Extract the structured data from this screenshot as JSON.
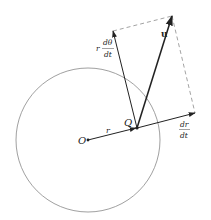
{
  "diagram": {
    "labels": {
      "origin": "O",
      "point": "Q",
      "radius": "r",
      "velocity": "u",
      "radial_num": "dr",
      "radial_den": "dt",
      "transverse_prefix": "r",
      "transverse_num": "dθ",
      "transverse_den": "dt"
    },
    "colors": {
      "stroke": "#222222",
      "circle": "#888888",
      "dashed": "#999999",
      "background": "#ffffff"
    }
  }
}
